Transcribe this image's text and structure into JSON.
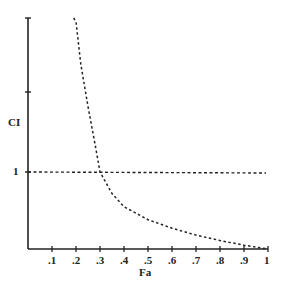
{
  "chart_data": {
    "type": "line",
    "title": "",
    "xlabel": "Fa",
    "ylabel": "CI",
    "xlim": [
      0,
      1
    ],
    "x_ticks": [
      ".1",
      ".2",
      ".3",
      ".4",
      ".5",
      ".6",
      ".7",
      ".8",
      ".9",
      "1"
    ],
    "y_ticks": [
      "1"
    ],
    "grid": false,
    "legend": null,
    "series": [
      {
        "name": "CI curve",
        "style": "dashed",
        "x": [
          0.19,
          0.2,
          0.22,
          0.25,
          0.28,
          0.3,
          0.35,
          0.4,
          0.5,
          0.6,
          0.7,
          0.8,
          0.9,
          1.0
        ],
        "y": [
          3.2,
          2.95,
          2.4,
          1.85,
          1.35,
          1.0,
          0.72,
          0.55,
          0.38,
          0.27,
          0.18,
          0.11,
          0.05,
          0.0
        ]
      },
      {
        "name": "CI = 1 reference",
        "style": "dashed",
        "x": [
          0,
          1
        ],
        "y": [
          1,
          1
        ]
      }
    ]
  },
  "labels": {
    "xlabel": "Fa",
    "ylabel": "CI",
    "y_one": "1",
    "x_ticks": [
      ".1",
      ".2",
      ".3",
      ".4",
      ".5",
      ".6",
      ".7",
      ".8",
      ".9",
      "1"
    ]
  }
}
